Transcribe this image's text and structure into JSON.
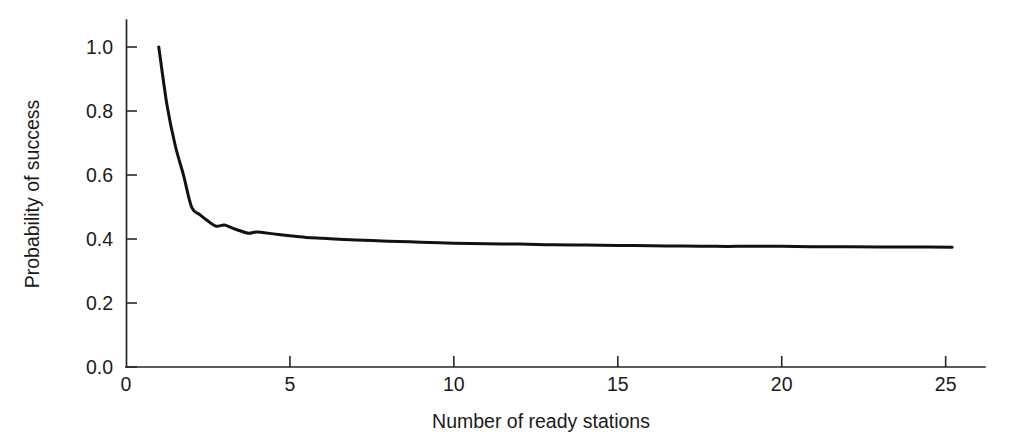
{
  "chart_data": {
    "type": "line",
    "title": "",
    "xlabel": "Number of ready stations",
    "ylabel": "Probability of success",
    "xlim": [
      0,
      26.2
    ],
    "ylim": [
      0.0,
      1.08
    ],
    "grid": false,
    "legend": null,
    "x_ticks": [
      {
        "value": 0,
        "label": "0"
      },
      {
        "value": 5,
        "label": "5"
      },
      {
        "value": 10,
        "label": "10"
      },
      {
        "value": 15,
        "label": "15"
      },
      {
        "value": 20,
        "label": "20"
      },
      {
        "value": 25,
        "label": "25"
      }
    ],
    "y_ticks": [
      {
        "value": 0.0,
        "label": "0.0"
      },
      {
        "value": 0.2,
        "label": "0.2"
      },
      {
        "value": 0.4,
        "label": "0.4"
      },
      {
        "value": 0.6,
        "label": "0.6"
      },
      {
        "value": 0.8,
        "label": "0.8"
      },
      {
        "value": 1.0,
        "label": "1.0"
      }
    ],
    "series": [
      {
        "name": "Probability of success",
        "color": "#111111",
        "x": [
          1,
          1.25,
          1.5,
          1.75,
          2,
          2.25,
          2.5,
          2.75,
          3,
          3.25,
          3.5,
          3.75,
          4,
          4.5,
          5,
          5.5,
          6,
          6.5,
          7,
          7.5,
          8,
          9,
          10,
          11,
          12,
          13,
          14,
          15,
          16,
          17,
          18,
          19,
          20,
          21,
          22,
          23,
          24,
          25.2
        ],
        "y": [
          1.0,
          0.819,
          0.693,
          0.601,
          0.5,
          0.476,
          0.456,
          0.44,
          0.444,
          0.434,
          0.425,
          0.418,
          0.422,
          0.416,
          0.41,
          0.405,
          0.402,
          0.399,
          0.397,
          0.395,
          0.393,
          0.39,
          0.387,
          0.385,
          0.384,
          0.382,
          0.381,
          0.38,
          0.379,
          0.378,
          0.377,
          0.377,
          0.377,
          0.376,
          0.376,
          0.375,
          0.375,
          0.374
        ]
      }
    ]
  },
  "axis_label_positions": {
    "ylabel_rotation": "-90"
  }
}
